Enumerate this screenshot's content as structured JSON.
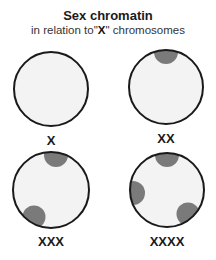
{
  "title": "Sex chromatin",
  "subtitle": {
    "prefix": "in relation to\"",
    "emphasis": "X",
    "suffix": "\" chromosomes"
  },
  "colors": {
    "nucleus_fill": "#f3f3f3",
    "nucleus_stroke": "#1a1a1a",
    "chromatin": "#7a7a7a",
    "background": "#ffffff"
  },
  "cells": [
    {
      "label": "X",
      "barr_bodies": 0
    },
    {
      "label": "XX",
      "barr_bodies": 1
    },
    {
      "label": "XXX",
      "barr_bodies": 2
    },
    {
      "label": "XXXX",
      "barr_bodies": 3
    }
  ]
}
